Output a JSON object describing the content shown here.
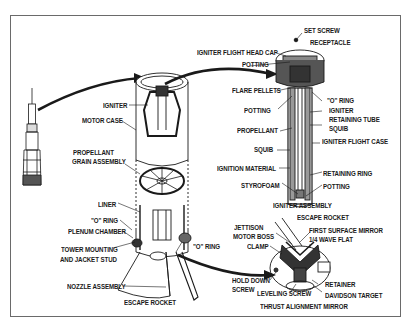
{
  "diagram": {
    "colors": {
      "ink": "#1a1a1a",
      "frame": "#6a6a6a",
      "background": "#ffffff"
    },
    "labels": {
      "igniter": "IGNITER",
      "motor_case": "MOTOR CASE",
      "propellant_grain_1": "PROPELLANT",
      "propellant_grain_2": "GRAIN ASSEMBLY",
      "liner": "LINER",
      "o_ring_left": "\"O\" RING",
      "plenum_chamber": "PLENUM CHAMBER",
      "tower_mounting_1": "TOWER MOUNTING",
      "tower_mounting_2": "AND JACKET STUD",
      "nozzle_assembly": "NOZZLE ASSEMBLY",
      "escape_rocket_bottom": "ESCAPE ROCKET",
      "o_ring_center": "\"O\" RING",
      "set_screw": "SET SCREW",
      "receptacle": "RECEPTACLE",
      "igniter_flight_head_cap": "IGNITER FLIGHT HEAD CAP",
      "potting_top": "POTTING",
      "flare_pellets": "FLARE PELLETS",
      "o_ring_right": "\"O\" RING",
      "potting_mid": "POTTING",
      "igniter_retaining_tube_1": "IGNITER",
      "igniter_retaining_tube_2": "RETAINING TUBE",
      "squib_right": "SQUIB",
      "propellant": "PROPELLANT",
      "igniter_flight_case": "IGNITER FLIGHT CASE",
      "squib_left": "SQUIB",
      "ignition_material": "IGNITION MATERIAL",
      "retaining_ring": "RETAINING RING",
      "styrofoam": "STYROFOAM",
      "potting_bottom": "POTTING",
      "igniter_assembly": "IGNITER ASSEMBLY",
      "escape_rocket_right": "ESCAPE ROCKET",
      "jettison_motor_boss_1": "JETTISON",
      "jettison_motor_boss_2": "MOTOR BOSS",
      "first_surface_mirror_1": "FIRST SURFACE MIRROR",
      "first_surface_mirror_2": "1/4 WAVE FLAT",
      "clamp": "CLAMP",
      "hold_down_screw_1": "HOLD DOWN",
      "hold_down_screw_2": "SCREW",
      "retainer": "RETAINER",
      "leveling_screw": "LEVELING SCREW",
      "davidson_target": "DAVIDSON TARGET",
      "thrust_alignment_mirror": "THRUST ALIGNMENT MIRROR"
    }
  }
}
